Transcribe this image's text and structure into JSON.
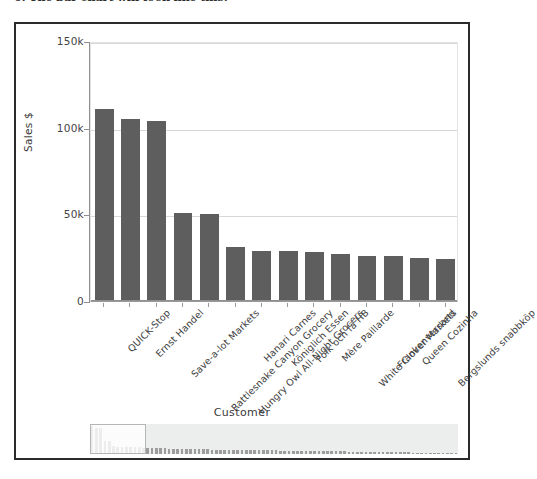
{
  "caption": {
    "text": "6. The bar chart will look like this:"
  },
  "panel": {
    "name": "Sales by Customer"
  },
  "chart_data": {
    "type": "bar",
    "title": "",
    "xlabel": "Customer",
    "ylabel": "Sales $",
    "ylim": [
      0,
      150000
    ],
    "grid": true,
    "legend": false,
    "orientation": "vertical",
    "bar_color": "#5e5e5e",
    "ytick_labels": [
      "0",
      "50k",
      "100k",
      "150k"
    ],
    "ytick_values": [
      0,
      50000,
      100000,
      150000
    ],
    "categories": [
      "QUICK-Stop",
      "Ernst Handel",
      "Save-a-lot Markets",
      "Rattlesnake Canyon Grocery",
      "Hungry Owl All-Night Grocers",
      "Hanari Carnes",
      "Königlich Essen",
      "Folk och fä HB",
      "Mère Paillarde",
      "White Clover Markets",
      "Frankenversand",
      "Queen Cozinha",
      "Bergslunds snabbköp"
    ],
    "values": [
      111000,
      105000,
      104000,
      51000,
      50000,
      31000,
      29000,
      29000,
      28000,
      27000,
      26000,
      26000,
      25000
    ],
    "extra_visible_bar_value": 24000,
    "visible_bar_count": 14,
    "values_displayed": [
      111000,
      105000,
      104000,
      51000,
      50000,
      31000,
      29000,
      29000,
      28000,
      27000,
      26000,
      26000,
      25000,
      24000
    ]
  },
  "navigator": {
    "label": "customer-scroll-navigator",
    "total_bars": 86,
    "window_start_index": 0,
    "window_bar_count": 13,
    "mini_values": [
      111000,
      105000,
      104000,
      51000,
      50000,
      31000,
      29000,
      29000,
      28000,
      27000,
      26000,
      26000,
      25000,
      24000,
      23500,
      23000,
      22500,
      22000,
      21500,
      21000,
      20500,
      20000,
      19500,
      19000,
      18800,
      18500,
      18200,
      18000,
      17800,
      17500,
      17200,
      17000,
      16800,
      16500,
      16200,
      16000,
      15800,
      15500,
      15200,
      15000,
      14800,
      14500,
      14200,
      14000,
      13800,
      13500,
      13200,
      13000,
      12800,
      12500,
      12200,
      12000,
      11800,
      11500,
      11200,
      11000,
      10800,
      10500,
      10200,
      10000,
      9800,
      9500,
      9200,
      9000,
      8800,
      8500,
      8200,
      8000,
      7800,
      7500,
      7200,
      7000,
      6800,
      6500,
      6200,
      6000,
      5800,
      5500,
      5200,
      5000,
      4700,
      4400,
      4100,
      3800,
      3400,
      3000
    ]
  }
}
